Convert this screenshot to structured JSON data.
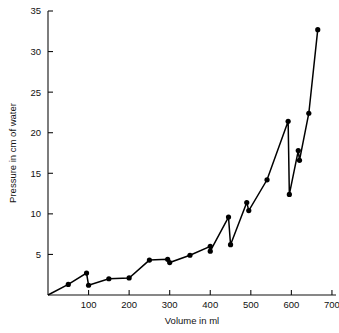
{
  "chart_data": {
    "type": "line",
    "title": "",
    "subtitle": "",
    "xlabel": "Volume in ml",
    "ylabel": "Pressure in cm of water",
    "xlim": [
      0,
      710
    ],
    "ylim": [
      0,
      35
    ],
    "xticks": [
      100,
      200,
      300,
      400,
      500,
      600,
      700
    ],
    "xtick_labels": [
      "100",
      "200",
      "300",
      "400",
      "500",
      "600",
      "700"
    ],
    "yticks": [
      5,
      10,
      15,
      20,
      25,
      30,
      35
    ],
    "ytick_labels": [
      "5",
      "10",
      "15",
      "20",
      "25",
      "30",
      "35"
    ],
    "grid": false,
    "legend": false,
    "legend_position": "none",
    "marker": "filled-circle",
    "line_color": "#000000",
    "marker_color": "#000000",
    "series": [
      {
        "name": "Pressure vs Volume",
        "x": [
          0,
          50,
          95,
          100,
          150,
          200,
          250,
          295,
          300,
          350,
          400,
          400,
          445,
          450,
          490,
          495,
          540,
          592,
          595,
          617,
          620,
          643,
          665
        ],
        "y": [
          0,
          1.3,
          2.7,
          1.2,
          2.0,
          2.1,
          4.3,
          4.4,
          4.0,
          4.9,
          6.0,
          5.4,
          9.6,
          6.2,
          11.4,
          10.4,
          14.2,
          21.4,
          12.4,
          17.8,
          16.6,
          22.4,
          32.7
        ]
      }
    ]
  },
  "axes": {
    "x_axis_title": "Volume in ml",
    "y_axis_title": "Pressure in cm of water"
  }
}
